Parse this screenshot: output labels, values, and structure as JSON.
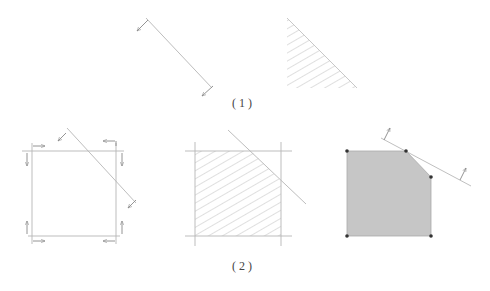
{
  "figure": {
    "part1_label": "(1)",
    "part2_label": "(2)"
  },
  "colors": {
    "line": "#9a9a9a",
    "hatch": "#b5b5b5",
    "fill": "#c8c8c8",
    "vertex": "#333333",
    "text": "#444444"
  },
  "part1": {
    "halfplane_line": {
      "from": [
        146,
        18
      ],
      "to": [
        212,
        88
      ],
      "arrow_direction": "down-left"
    },
    "hatched_triangle": {
      "vertices": [
        [
          287,
          18
        ],
        [
          287,
          88
        ],
        [
          357,
          88
        ]
      ]
    }
  },
  "part2": {
    "constraint_square": {
      "x_min": 32,
      "x_max": 116,
      "y_min": 151,
      "y_max": 236,
      "arrows": "inward"
    },
    "diagonal_constraint": {
      "from": [
        67,
        128
      ],
      "to": [
        136,
        203
      ]
    },
    "intersection_region": {
      "description": "square cut by diagonal, hatched"
    },
    "feasible_polygon": {
      "vertices": [
        [
          347,
          151
        ],
        [
          406,
          151
        ],
        [
          431,
          177
        ],
        [
          431,
          236
        ],
        [
          347,
          236
        ]
      ],
      "objective_line": {
        "from": [
          381,
          138
        ],
        "to": [
          471,
          186
        ],
        "arrow_direction": "up-right"
      }
    }
  }
}
